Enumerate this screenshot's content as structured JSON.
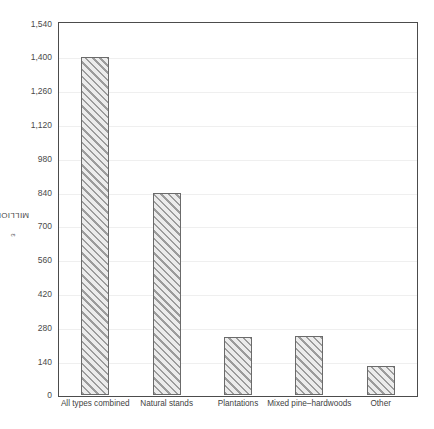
{
  "chart_data": {
    "type": "bar",
    "title": "",
    "subtitle": "",
    "xlabel": "",
    "ylabel": "MILLION m³",
    "ylabel_text": "MILLION m",
    "ylabel_superscript": "3",
    "categories": [
      "All types combined",
      "Natural stands",
      "Plantations",
      "Mixed pine–hardwoods",
      "Other"
    ],
    "values": [
      1400,
      840,
      240,
      245,
      120
    ],
    "ylim": [
      0,
      1540
    ],
    "y_ticks": [
      0,
      140,
      280,
      420,
      560,
      700,
      840,
      980,
      1120,
      1260,
      1400,
      1540
    ],
    "y_tick_labels": [
      "0",
      "140",
      "280",
      "420",
      "560",
      "700",
      "840",
      "980",
      "1,120",
      "1,260",
      "1,400",
      "1,540"
    ],
    "grid": true,
    "grid_axis": "y",
    "legend": false,
    "legend_position": "none",
    "bar_fill": "#e6e6e6",
    "bar_hatch": "diagonal-45",
    "bar_hatch_color": "#9c9c9c",
    "bar_edge_color": "#6b6b6b",
    "gridline_color": "#efefef",
    "axis_color": "#4c4c4c",
    "background_color": "#ffffff"
  }
}
